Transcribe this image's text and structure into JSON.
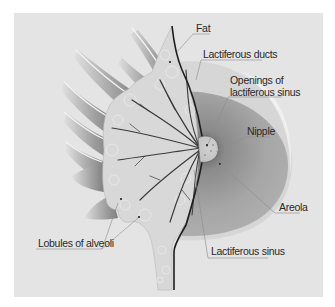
{
  "diagram": {
    "background_color": "#e4e4e4",
    "labels": {
      "fat": "Fat",
      "lactiferous_ducts": "Lactiferous ducts",
      "openings_line1": "Openings of",
      "openings_line2": "lactiferous sinus",
      "nipple": "Nipple",
      "areola": "Areola",
      "lobules": "Lobules of alveoli",
      "lactiferous_sinus": "Lactiferous sinus"
    },
    "colors": {
      "tissue": "#d9d9d9",
      "areola_dark": "#8a8a8a",
      "areola_light": "#a9a9a9",
      "ducts": "#3a3a3a",
      "outline": "#1e1e1e",
      "muscle": "#9a9a9a",
      "leader_line": "#8c8c8c"
    }
  }
}
